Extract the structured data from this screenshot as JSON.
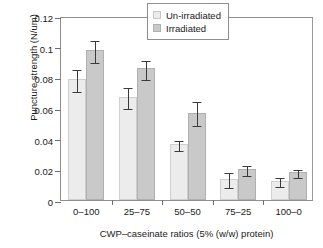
{
  "chart_data": {
    "type": "bar",
    "title": "",
    "xlabel": "CWP–caseinate ratios (5% (w/w) protein)",
    "ylabel": "Puncture strength (N/um)",
    "categories": [
      "0–100",
      "25–75",
      "50–50",
      "75–25",
      "100–0"
    ],
    "ylim": [
      0,
      0.12
    ],
    "ytick_labels": [
      "0",
      "0.02",
      "0.04",
      "0.06",
      "0.08",
      "0.1",
      "0.12"
    ],
    "ytick_values": [
      0,
      0.02,
      0.04,
      0.06,
      0.08,
      0.1,
      0.12
    ],
    "grid": false,
    "legend_position": "top-right",
    "series": [
      {
        "name": "Un-irradiated",
        "color": "#ececec",
        "values": [
          0.079,
          0.0675,
          0.0365,
          0.014,
          0.0125
        ],
        "err_low": [
          0.0715,
          0.0608,
          0.0335,
          0.0093,
          0.01
        ],
        "err_high": [
          0.0862,
          0.0742,
          0.0398,
          0.0188,
          0.0157
        ]
      },
      {
        "name": "Irradiated",
        "color": "#c9c9c9",
        "values": [
          0.0978,
          0.086,
          0.057,
          0.02,
          0.018
        ],
        "err_low": [
          0.0908,
          0.0795,
          0.0493,
          0.017,
          0.0155
        ],
        "err_high": [
          0.1048,
          0.0918,
          0.065,
          0.0233,
          0.021
        ]
      }
    ]
  },
  "legend": {
    "items": [
      {
        "label": "Un-irradiated",
        "swatch": "light"
      },
      {
        "label": "Irradiated",
        "swatch": "dark"
      }
    ]
  }
}
